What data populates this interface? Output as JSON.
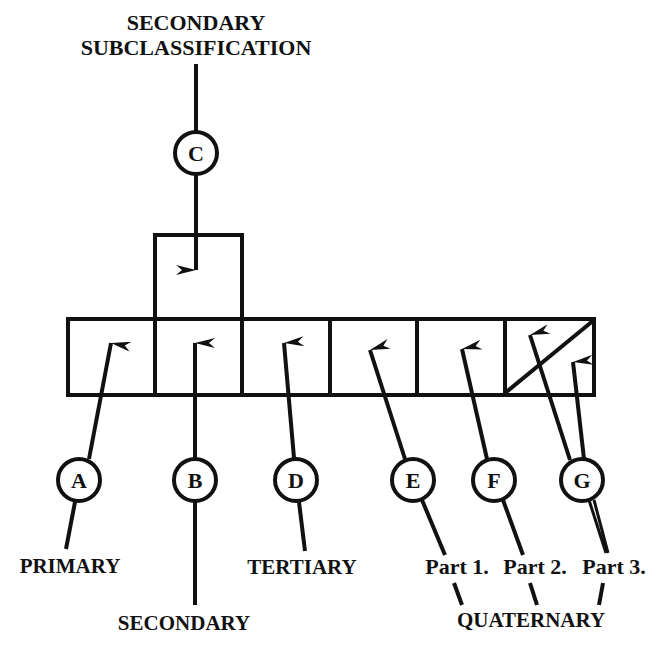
{
  "diagram": {
    "title_lines": [
      "SECONDARY",
      "SUBCLASSIFICATION"
    ],
    "colors": {
      "ink": "#111111",
      "background": "#ffffff"
    },
    "circles": [
      {
        "id": "A",
        "label": "A"
      },
      {
        "id": "B",
        "label": "B"
      },
      {
        "id": "C",
        "label": "C"
      },
      {
        "id": "D",
        "label": "D"
      },
      {
        "id": "E",
        "label": "E"
      },
      {
        "id": "F",
        "label": "F"
      },
      {
        "id": "G",
        "label": "G"
      }
    ],
    "labels": {
      "primary": "PRIMARY",
      "secondary": "SECONDARY",
      "tertiary": "TERTIARY",
      "part1": "Part 1.",
      "part2": "Part 2.",
      "part3": "Part 3.",
      "quaternary": "QUATERNARY"
    },
    "cells": [
      "primary",
      "secondary",
      "tertiary",
      "quaternary-part-1",
      "quaternary-part-2",
      "quaternary-part-3"
    ]
  }
}
